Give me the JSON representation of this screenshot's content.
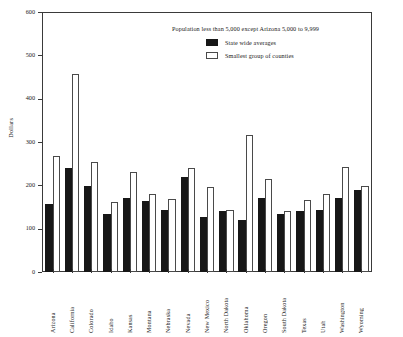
{
  "chart_data": {
    "type": "bar",
    "title": "",
    "annotation": "Population less than 5,000 except Arizona 5,000 to 9,999",
    "xlabel": "",
    "ylabel": "Dollars",
    "ylim": [
      0,
      600
    ],
    "yticks": [
      0,
      100,
      200,
      300,
      400,
      500,
      600
    ],
    "grid": false,
    "legend_position": "top-center",
    "categories": [
      "Arizona",
      "California",
      "Colorado",
      "Idaho",
      "Kansas",
      "Montana",
      "Nebraska",
      "Nevada",
      "New Mexico",
      "North Dakota",
      "Oklahoma",
      "Oregon",
      "South Dakota",
      "Texas",
      "Utah",
      "Washington",
      "Wyoming"
    ],
    "series": [
      {
        "name": "State wide averages",
        "color": "#171717",
        "values": [
          158,
          240,
          198,
          135,
          170,
          163,
          143,
          219,
          126,
          140,
          119,
          170,
          135,
          140,
          143,
          170,
          190
        ]
      },
      {
        "name": "Smallest group of counties",
        "color": "#ffffff",
        "values": [
          267,
          458,
          254,
          162,
          231,
          179,
          168,
          240,
          196,
          143,
          316,
          215,
          141,
          166,
          180,
          242,
          199
        ]
      }
    ]
  },
  "axis": {
    "y_title": "Dollars",
    "tick_labels": [
      "0",
      "100",
      "200",
      "300",
      "400",
      "500",
      "600"
    ]
  },
  "caption": {
    "text": ""
  }
}
